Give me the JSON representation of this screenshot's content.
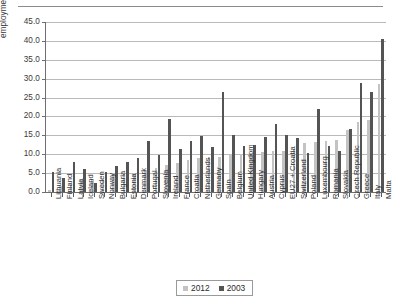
{
  "figure": {
    "top_rule": true
  },
  "legend": {
    "position": "bottom-center",
    "entries": [
      {
        "label": "2012",
        "color": "#c3c3c3"
      },
      {
        "label": "2003",
        "color": "#545454"
      }
    ]
  },
  "chart_data": {
    "type": "bar",
    "title": "",
    "subtitle": "",
    "xlabel": "",
    "ylabel": "employment rate gap, %",
    "ylim": [
      0.0,
      45.0
    ],
    "ytick_labels": [
      "0.0",
      "5.0",
      "10.0",
      "15.0",
      "20.0",
      "25.0",
      "30.0",
      "35.0",
      "40.0",
      "45.0"
    ],
    "ytick_values": [
      0.0,
      5.0,
      10.0,
      15.0,
      20.0,
      25.0,
      30.0,
      35.0,
      40.0,
      45.0
    ],
    "grid": true,
    "grid_axis": "y",
    "legend_position": "bottom-center",
    "categories": [
      "Lithuania",
      "Finland",
      "Latvia",
      "Iceland",
      "Sweden",
      "Norway",
      "Bulgaria",
      "Estonia",
      "Denmark",
      "Portugal",
      "Slovenia",
      "Ireland",
      "France",
      "Croatia",
      "Netherlands",
      "Germany",
      "Spain",
      "Belgium",
      "United Kingdom",
      "Hungary",
      "Austria",
      "Cyprus",
      "EU27 + Croatia",
      "Switzerland",
      "Poland",
      "Luxembourg",
      "Romania",
      "Slovakia",
      "Czech Republic",
      "Greece",
      "Italy",
      "Malta"
    ],
    "series": [
      {
        "name": "2012",
        "color": "#c3c3c3",
        "values": [
          0.6,
          1.5,
          2.1,
          3.3,
          3.4,
          3.4,
          4.8,
          4.9,
          5.0,
          5.8,
          6.4,
          7.2,
          7.6,
          8.5,
          9.1,
          9.3,
          9.4,
          10.0,
          10.0,
          10.2,
          10.7,
          10.8,
          10.9,
          11.3,
          13.0,
          13.2,
          13.6,
          13.8,
          16.4,
          18.5,
          19.0,
          28.7
        ]
      },
      {
        "name": "2003",
        "color": "#545454",
        "values": [
          5.4,
          3.7,
          8.0,
          6.0,
          2.5,
          5.4,
          6.8,
          8.0,
          9.0,
          13.4,
          9.8,
          19.2,
          11.5,
          13.4,
          14.9,
          11.8,
          26.6,
          15.2,
          12.3,
          12.4,
          14.6,
          18.1,
          15.2,
          14.2,
          10.2,
          22.1,
          12.1,
          10.9,
          16.6,
          28.8,
          26.5,
          40.5
        ]
      }
    ]
  }
}
